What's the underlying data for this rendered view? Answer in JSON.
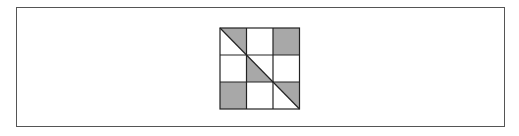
{
  "diagram": {
    "type": "3x3 grid puzzle",
    "rows": 3,
    "cols": 3,
    "colors": {
      "border": "#555555",
      "grid_line": "#222222",
      "fill": "#a8a8a8",
      "background": "#ffffff"
    },
    "cells": [
      [
        "upper-right-triangle",
        "empty",
        "full"
      ],
      [
        "empty",
        "lower-left-triangle",
        "empty"
      ],
      [
        "full",
        "empty",
        "upper-right-triangle"
      ]
    ],
    "diagonal": "top-left to bottom-right"
  }
}
